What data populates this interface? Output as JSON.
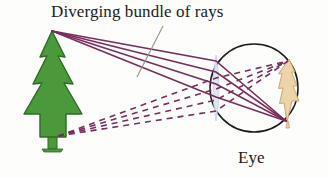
{
  "diagram": {
    "title": "Diverging bundle of rays",
    "subject_label": "Eye",
    "background_color": "#fdfdfc",
    "colors": {
      "ray": "#7B2D5E",
      "tree_green": "#4A9A3C",
      "tree_outline": "#2E6B25",
      "retina_image": "#EDD3A8",
      "retina_outline": "#C9A770",
      "lens": "#DCE6F0",
      "lens_outline": "#B9C9DC",
      "eye_outline": "#1c1c1c",
      "leader_line": "#8a9a8a",
      "text": "#1c1c1c"
    },
    "objects": {
      "tree": {
        "name": "pine-tree",
        "apex_point": [
          52,
          31
        ],
        "base_point": [
          55,
          140
        ]
      },
      "eye": {
        "name": "eye-ball",
        "center": [
          254,
          88
        ],
        "radius": 44
      },
      "lens": {
        "name": "eye-lens",
        "center": [
          216,
          88
        ],
        "half_height": 33,
        "half_width": 5
      },
      "retina_image": {
        "name": "inverted-retinal-image",
        "description": "inverted tree image on retina",
        "top_point": [
          289,
          59
        ],
        "bottom_point": [
          286,
          122
        ]
      }
    },
    "rays": {
      "solid": {
        "label": "rays from treetop",
        "style": "solid",
        "count": 4,
        "origin": [
          52,
          31
        ],
        "converge_at": [
          286,
          121
        ]
      },
      "dashed": {
        "label": "rays from tree base",
        "style": "dashed",
        "count": 4,
        "origin": [
          58,
          136
        ],
        "converge_at": [
          288,
          61
        ]
      }
    },
    "leader_line": {
      "name": "title-leader-line",
      "from": [
        163,
        26
      ],
      "to": [
        137,
        76
      ]
    }
  }
}
